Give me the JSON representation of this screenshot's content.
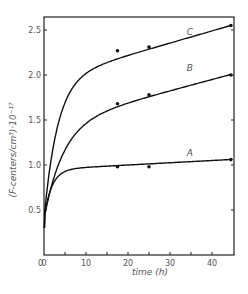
{
  "chart_data": {
    "type": "line",
    "title": "",
    "xlabel": "time (h)",
    "ylabel": "(F-centers/cm³)·10⁻¹⁷",
    "xlim": [
      0,
      45
    ],
    "ylim": [
      0,
      2.65
    ],
    "x_ticks": [
      "0",
      "10",
      "20",
      "30",
      "40"
    ],
    "y_ticks": [
      "0.5",
      "1.0",
      "1.5",
      "2.0",
      "2.5"
    ],
    "grid": false,
    "series": [
      {
        "name": "A",
        "points": [
          [
            0.2,
            0.38
          ],
          [
            0.5,
            0.58
          ],
          [
            1,
            0.62
          ],
          [
            17.5,
            0.98
          ],
          [
            25,
            0.98
          ],
          [
            44.5,
            1.06
          ]
        ]
      },
      {
        "name": "B",
        "points": [
          [
            0.2,
            0.38
          ],
          [
            0.5,
            0.55
          ],
          [
            1,
            0.75
          ],
          [
            17.5,
            1.68
          ],
          [
            25,
            1.78
          ],
          [
            44.5,
            2.0
          ]
        ]
      },
      {
        "name": "C",
        "points": [
          [
            0.2,
            0.4
          ],
          [
            0.5,
            0.6
          ],
          [
            1,
            0.98
          ],
          [
            17.5,
            2.27
          ],
          [
            25,
            2.31
          ],
          [
            44.5,
            2.55
          ]
        ]
      }
    ]
  }
}
